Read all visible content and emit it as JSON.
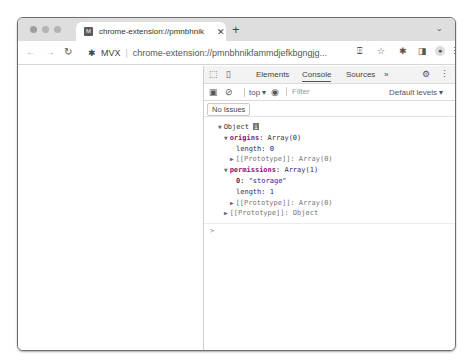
{
  "browser": {
    "tab": {
      "favicon_letter": "M",
      "title": "chrome-extension://pmnbhnik",
      "close_icon": "close-icon"
    },
    "newtab_icon": "+",
    "tab_menu_icon": "⌄",
    "nav": {
      "back": "←",
      "forward": "→",
      "reload": "C"
    },
    "omnibox": {
      "extension_icon": "puzzle-icon",
      "extension_name": "MVX",
      "separator": "|",
      "url": "chrome-extension://pmnbhnikfammdjefkbgngjg..."
    },
    "toolbar_icons": [
      "share-icon",
      "star-icon",
      "extensions-icon",
      "sidepanel-icon",
      "profile-icon",
      "menu-icon"
    ]
  },
  "devtools": {
    "tabs": [
      {
        "label": "Elements",
        "active": false
      },
      {
        "label": "Console",
        "active": true
      },
      {
        "label": "Sources",
        "active": false
      }
    ],
    "more_tabs": "»",
    "filterbar": {
      "context": "top ▾",
      "filter_placeholder": "Filter",
      "levels": "Default levels ▾"
    },
    "issues": "No Issues",
    "console": {
      "lines": [
        {
          "indent": 0,
          "text": "Object"
        },
        {
          "indent": 1,
          "key": "origins",
          "value": "Array(0)"
        },
        {
          "indent": 2,
          "key": "length",
          "value": "0"
        },
        {
          "indent": 2,
          "text": "[[Prototype]]: Array(0)"
        },
        {
          "indent": 1,
          "key": "permissions",
          "value": "Array(1)"
        },
        {
          "indent": 2,
          "key": "0",
          "value": "\"storage\""
        },
        {
          "indent": 2,
          "key": "length",
          "value": "1"
        },
        {
          "indent": 2,
          "text": "[[Prototype]]: Array(0)"
        },
        {
          "indent": 1,
          "text": "[[Prototype]]: Object"
        }
      ],
      "prompt": ">"
    }
  }
}
